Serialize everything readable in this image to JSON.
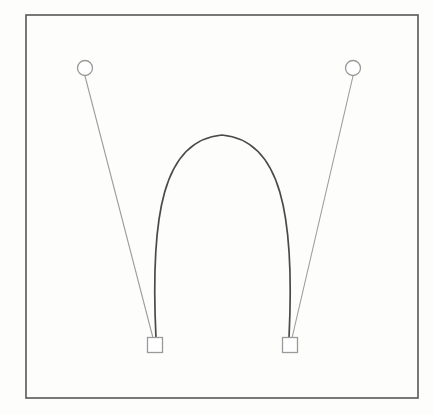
{
  "figure": {
    "name": "pendulum-arch-diagram",
    "background_color": "#fdfdfc",
    "width": 434,
    "height": 415
  },
  "frame": {
    "name": "outer-frame",
    "x": 26,
    "y": 15,
    "width": 392,
    "height": 383,
    "stroke_color": "#575757",
    "stroke_width": 1.6,
    "fill": "none"
  },
  "nodes": {
    "circles": [
      {
        "id": "circle-left",
        "label": "left-anchor-node",
        "cx": 85,
        "cy": 68,
        "r": 7.5,
        "stroke_color": "#9a9a9a",
        "stroke_width": 1.3,
        "fill": "#ffffff"
      },
      {
        "id": "circle-right",
        "label": "right-anchor-node",
        "cx": 353,
        "cy": 68,
        "r": 7.5,
        "stroke_color": "#9a9a9a",
        "stroke_width": 1.3,
        "fill": "#ffffff"
      }
    ],
    "squares": [
      {
        "id": "square-left",
        "label": "left-base-block",
        "cx": 155,
        "cy": 345,
        "size": 15,
        "stroke_color": "#9a9a9a",
        "stroke_width": 1.3,
        "fill": "#ffffff"
      },
      {
        "id": "square-right",
        "label": "right-base-block",
        "cx": 290,
        "cy": 345,
        "size": 15,
        "stroke_color": "#9a9a9a",
        "stroke_width": 1.3,
        "fill": "#ffffff"
      }
    ]
  },
  "connectors": [
    {
      "id": "tether-left",
      "label": "left-tether-line",
      "x1": 85,
      "y1": 76,
      "x2": 153,
      "y2": 338,
      "stroke_color": "#9d9d9d",
      "stroke_width": 1.1
    },
    {
      "id": "tether-right",
      "label": "right-tether-line",
      "x1": 353,
      "y1": 76,
      "x2": 292,
      "y2": 338,
      "stroke_color": "#9d9d9d",
      "stroke_width": 1.1
    }
  ],
  "arch": {
    "id": "arch-curve",
    "label": "arch-curve",
    "path": "M 156 338 C 150 215 163 140 222 135 C 281 140 295 215 289 338",
    "stroke_color": "#4a4a4a",
    "stroke_width": 1.7,
    "fill": "none",
    "apex": {
      "x": 222,
      "y": 135
    },
    "left_foot": {
      "x": 156,
      "y": 338
    },
    "right_foot": {
      "x": 289,
      "y": 338
    },
    "left_extent_x": 152,
    "right_extent_x": 295
  },
  "chart_data": {
    "type": "scatter",
    "title": "",
    "xlabel": "",
    "ylabel": "",
    "annotations": [],
    "points": [
      {
        "name": "left-anchor-node",
        "shape": "circle",
        "x": 85,
        "y": 68
      },
      {
        "name": "right-anchor-node",
        "shape": "circle",
        "x": 353,
        "y": 68
      },
      {
        "name": "left-base-block",
        "shape": "square",
        "x": 155,
        "y": 345
      },
      {
        "name": "right-base-block",
        "shape": "square",
        "x": 290,
        "y": 345
      },
      {
        "name": "arch-apex",
        "shape": "none",
        "x": 222,
        "y": 135
      }
    ],
    "edges": [
      {
        "from": "left-anchor-node",
        "to": "left-base-block",
        "style": "straight-thin"
      },
      {
        "from": "right-anchor-node",
        "to": "right-base-block",
        "style": "straight-thin"
      },
      {
        "from": "left-base-block",
        "to": "right-base-block",
        "style": "arch-curve-thick"
      }
    ]
  }
}
